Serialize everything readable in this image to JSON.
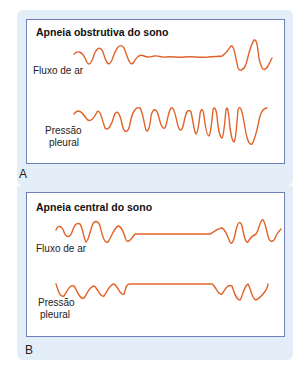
{
  "panels": [
    {
      "letter": "A",
      "title": "Apneia obstrutiva do sono",
      "trace_labels": {
        "airflow": "Fluxo de ar",
        "pressure_line1": "Pressão",
        "pressure_line2": "pleural"
      }
    },
    {
      "letter": "B",
      "title": "Apneia central do sono",
      "trace_labels": {
        "airflow": "Fluxo de ar",
        "pressure_line1": "Pressão",
        "pressure_line2": "pleural"
      }
    }
  ],
  "colors": {
    "trace": "#e0642a",
    "frame": "#6f7fb8",
    "background": "#e4eef8"
  }
}
